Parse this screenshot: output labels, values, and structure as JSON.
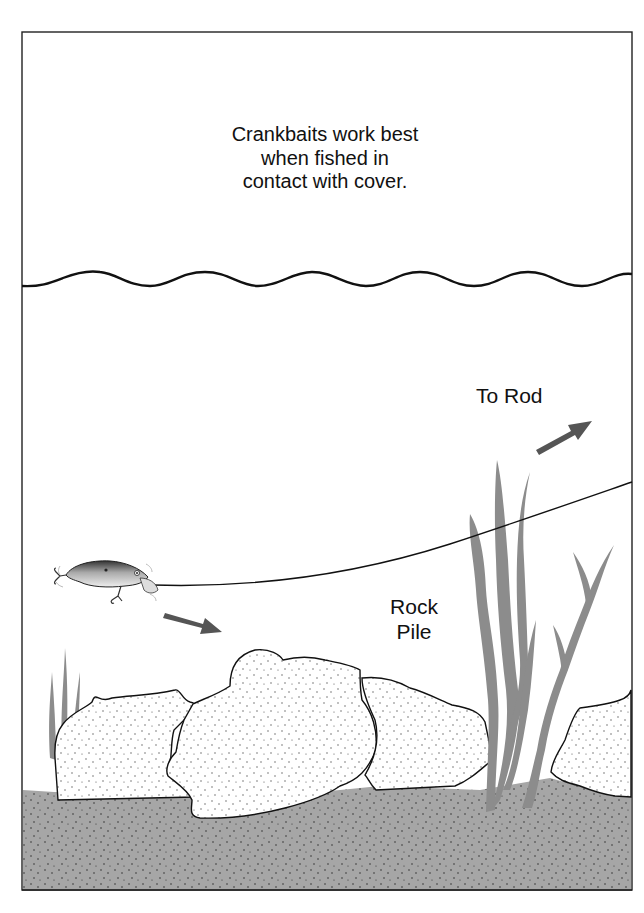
{
  "diagram": {
    "caption_lines": [
      "Crankbaits work best",
      "when fished in",
      "contact with cover."
    ],
    "labels": {
      "to_rod": "To Rod",
      "rock_pile_lines": [
        "Rock",
        "Pile"
      ]
    },
    "elements": [
      {
        "name": "water-surface",
        "type": "wavy-line"
      },
      {
        "name": "crankbait-lure",
        "type": "icon"
      },
      {
        "name": "fishing-line",
        "type": "curve",
        "direction": "to rod"
      },
      {
        "name": "lure-direction-arrow",
        "direction": "down-right"
      },
      {
        "name": "rod-direction-arrow",
        "direction": "up-right"
      },
      {
        "name": "rock-pile",
        "type": "rocks",
        "count": 5
      },
      {
        "name": "weeds",
        "type": "plants"
      },
      {
        "name": "lake-bottom",
        "type": "ground"
      }
    ],
    "colors": {
      "frame": "#222222",
      "ground": "#a6a6a6",
      "rock_fill": "#ffffff",
      "weed": "#8c8c8c",
      "arrow": "#555555",
      "text": "#111111"
    }
  }
}
